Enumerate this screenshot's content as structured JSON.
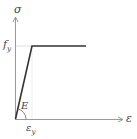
{
  "diagram": {
    "y_axis_label": "σ",
    "x_axis_label": "ε",
    "yield_stress_label": "f",
    "yield_stress_sub": "y",
    "yield_strain_label": "ε",
    "yield_strain_sub": "y",
    "modulus_label": "E",
    "colors": {
      "axis": "#999999",
      "curve": "#333333",
      "guide": "#dddddd",
      "text": "#444444"
    }
  }
}
